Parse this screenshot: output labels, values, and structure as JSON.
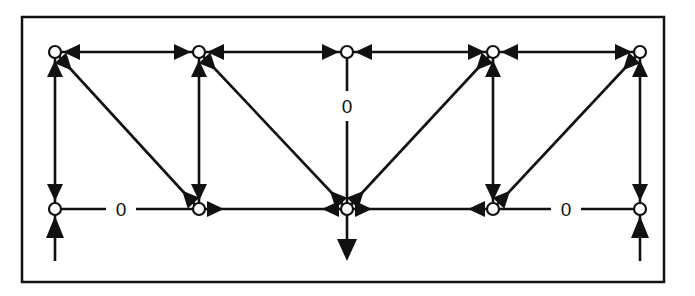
{
  "diagram": {
    "type": "truss-force-diagram",
    "frame": {
      "x": 22,
      "y": 17,
      "width": 642,
      "height": 265
    },
    "colors": {
      "stroke": "#111111",
      "node_fill": "#ffffff",
      "background": "#ffffff"
    },
    "nodes": [
      {
        "id": "T1",
        "x": 55,
        "y": 52
      },
      {
        "id": "T2",
        "x": 199,
        "y": 52
      },
      {
        "id": "T3",
        "x": 347,
        "y": 52
      },
      {
        "id": "T4",
        "x": 493,
        "y": 52
      },
      {
        "id": "T5",
        "x": 640,
        "y": 52
      },
      {
        "id": "B1",
        "x": 55,
        "y": 209
      },
      {
        "id": "B2",
        "x": 199,
        "y": 209
      },
      {
        "id": "B3",
        "x": 347,
        "y": 209
      },
      {
        "id": "B4",
        "x": 493,
        "y": 209
      },
      {
        "id": "B5",
        "x": 640,
        "y": 209
      }
    ],
    "members": [
      {
        "id": "top-1",
        "from": "T1",
        "to": "T2",
        "force": "compression"
      },
      {
        "id": "top-2",
        "from": "T2",
        "to": "T3",
        "force": "compression"
      },
      {
        "id": "top-3",
        "from": "T3",
        "to": "T4",
        "force": "compression"
      },
      {
        "id": "top-4",
        "from": "T4",
        "to": "T5",
        "force": "compression"
      },
      {
        "id": "vert-1",
        "from": "T1",
        "to": "B1",
        "force": "compression"
      },
      {
        "id": "vert-2",
        "from": "T2",
        "to": "B2",
        "force": "compression"
      },
      {
        "id": "vert-3",
        "from": "T3",
        "to": "B3",
        "force": "zero",
        "label": "0"
      },
      {
        "id": "vert-4",
        "from": "T4",
        "to": "B4",
        "force": "compression"
      },
      {
        "id": "vert-5",
        "from": "T5",
        "to": "B5",
        "force": "compression"
      },
      {
        "id": "bottom-1",
        "from": "B1",
        "to": "B2",
        "force": "zero",
        "label": "0"
      },
      {
        "id": "bottom-2",
        "from": "B2",
        "to": "B3",
        "force": "tension"
      },
      {
        "id": "bottom-3",
        "from": "B3",
        "to": "B4",
        "force": "tension"
      },
      {
        "id": "bottom-4",
        "from": "B4",
        "to": "B5",
        "force": "zero",
        "label": "0"
      },
      {
        "id": "diag-1",
        "from": "T1",
        "to": "B2",
        "force": "tension"
      },
      {
        "id": "diag-2",
        "from": "T2",
        "to": "B3",
        "force": "tension"
      },
      {
        "id": "diag-3",
        "from": "T4",
        "to": "B3",
        "force": "tension"
      },
      {
        "id": "diag-4",
        "from": "T5",
        "to": "B4",
        "force": "tension"
      }
    ],
    "loads": [
      {
        "id": "reaction-left",
        "node": "B1",
        "direction": "up"
      },
      {
        "id": "applied-load-center",
        "node": "B3",
        "direction": "down"
      },
      {
        "id": "reaction-right",
        "node": "B5",
        "direction": "up"
      }
    ],
    "zero_labels": [
      {
        "member": "vert-3",
        "text": "0",
        "x": 347,
        "y": 106
      },
      {
        "member": "bottom-1",
        "text": "0",
        "x": 121,
        "y": 209
      },
      {
        "member": "bottom-4",
        "text": "0",
        "x": 566,
        "y": 209
      }
    ]
  }
}
